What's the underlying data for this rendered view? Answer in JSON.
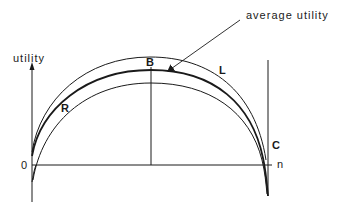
{
  "diagram": {
    "axes": {
      "y_label": "utility",
      "x_label": "n",
      "origin_label": "0"
    },
    "curves": [
      {
        "id": "L",
        "label": "L",
        "description": "upper curve"
      },
      {
        "id": "average",
        "label": "average utility",
        "description": "middle thick curve"
      },
      {
        "id": "R",
        "label": "R",
        "description": "lower curve"
      }
    ],
    "points": {
      "B": "B",
      "C": "C"
    },
    "annotation": {
      "text": "average utility",
      "target": "average"
    },
    "colors": {
      "line": "#1a1a1a",
      "background": "#ffffff"
    }
  }
}
